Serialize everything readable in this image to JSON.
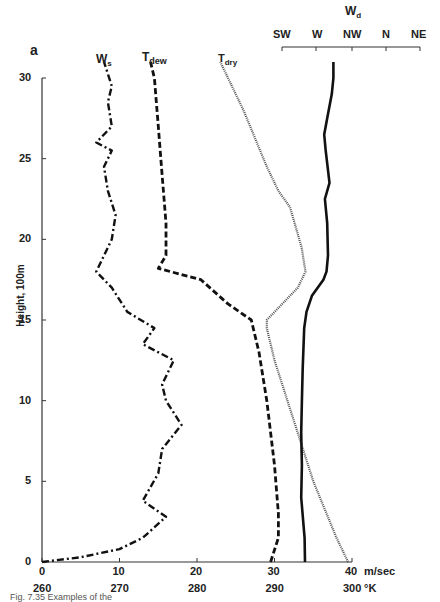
{
  "figure": {
    "panel_letter": "a",
    "caption_partial": "Fig. 7.35   Examples of the"
  },
  "chart_data": {
    "type": "line",
    "title": "",
    "ylabel": "Height, 100m",
    "ylim": [
      0,
      30
    ],
    "yticks": [
      0,
      5,
      10,
      15,
      20,
      25,
      30
    ],
    "x_axes": [
      {
        "name": "speed",
        "label": "m/sec",
        "ticks": [
          0,
          10,
          20,
          30,
          40
        ],
        "range": [
          0,
          40
        ]
      },
      {
        "name": "temperature",
        "label": "°K",
        "ticks": [
          260,
          270,
          280,
          290,
          300
        ],
        "range": [
          260,
          300
        ]
      },
      {
        "name": "direction",
        "label": "Wd",
        "position": "top",
        "ticks": [
          "SW",
          "W",
          "NW",
          "N",
          "NE"
        ]
      }
    ],
    "grid": false,
    "series": [
      {
        "name": "Ws",
        "axis": "speed",
        "style": "dash-dot",
        "points": [
          [
            0,
            0
          ],
          [
            5,
            0.3
          ],
          [
            10,
            0.8
          ],
          [
            13,
            1.5
          ],
          [
            16,
            2.8
          ],
          [
            13,
            3.8
          ],
          [
            15,
            5.5
          ],
          [
            15.5,
            7
          ],
          [
            18,
            8.5
          ],
          [
            16,
            10
          ],
          [
            15.5,
            11
          ],
          [
            17,
            12.5
          ],
          [
            13,
            13.5
          ],
          [
            14.5,
            14.5
          ],
          [
            11,
            15.5
          ],
          [
            9,
            17
          ],
          [
            7,
            18
          ],
          [
            9,
            20
          ],
          [
            9.5,
            21.5
          ],
          [
            8.5,
            23
          ],
          [
            8,
            24.5
          ],
          [
            9,
            25.5
          ],
          [
            7,
            26
          ],
          [
            9,
            27
          ],
          [
            8.5,
            28.5
          ],
          [
            9,
            29.5
          ],
          [
            8,
            31
          ]
        ]
      },
      {
        "name": "Tdew",
        "axis": "temperature",
        "style": "dashed",
        "points": [
          [
            289.5,
            0
          ],
          [
            290.5,
            1.5
          ],
          [
            290.5,
            3
          ],
          [
            290,
            6
          ],
          [
            289,
            10
          ],
          [
            288,
            13
          ],
          [
            287,
            15
          ],
          [
            284,
            16
          ],
          [
            280.5,
            17.5
          ],
          [
            275,
            18.2
          ],
          [
            276,
            19
          ],
          [
            276,
            21
          ],
          [
            275.5,
            24
          ],
          [
            275,
            27
          ],
          [
            274.5,
            30
          ],
          [
            274,
            31
          ]
        ]
      },
      {
        "name": "Tdry",
        "axis": "temperature",
        "style": "dotted",
        "points": [
          [
            299.5,
            0
          ],
          [
            298,
            1.5
          ],
          [
            295,
            5
          ],
          [
            292,
            9.5
          ],
          [
            290,
            12.5
          ],
          [
            289,
            14.5
          ],
          [
            289,
            15
          ],
          [
            293,
            17
          ],
          [
            294,
            18
          ],
          [
            293.5,
            19.5
          ],
          [
            292,
            22
          ],
          [
            290.5,
            23
          ],
          [
            289,
            24.5
          ],
          [
            286,
            28
          ],
          [
            283,
            31
          ]
        ]
      },
      {
        "name": "Wd",
        "axis": "direction",
        "style": "solid",
        "points_deg": [
          [
            255,
            0
          ],
          [
            254.5,
            1.5
          ],
          [
            250,
            4
          ],
          [
            251,
            6
          ],
          [
            250,
            8
          ],
          [
            251,
            10
          ],
          [
            252,
            12
          ],
          [
            254,
            14.5
          ],
          [
            257,
            15.5
          ],
          [
            264,
            16.5
          ],
          [
            279,
            17.5
          ],
          [
            283,
            18
          ],
          [
            285,
            19
          ],
          [
            284,
            21
          ],
          [
            281,
            22.5
          ],
          [
            287,
            23.5
          ],
          [
            282,
            25.5
          ],
          [
            280,
            26.5
          ],
          [
            284,
            27.5
          ],
          [
            290,
            29
          ],
          [
            292,
            30
          ],
          [
            292,
            31
          ]
        ]
      }
    ],
    "legend": [
      "Ws",
      "Tdew",
      "Tdry",
      "Wd"
    ],
    "legend_position": "inline labels at top of each curve"
  },
  "labels": {
    "ws": "W",
    "ws_sub": "s",
    "tdew": "T",
    "tdew_sub": "dew",
    "tdry": "T",
    "tdry_sub": "dry",
    "wd": "W",
    "wd_sub": "d",
    "x_speed_unit": "m/sec",
    "x_temp_unit": "°K",
    "y_label": "Height, 100m",
    "y_ticks": [
      "0",
      "5",
      "10",
      "15",
      "20",
      "25",
      "30"
    ],
    "x_speed_ticks": [
      "0",
      "10",
      "20",
      "30",
      "40"
    ],
    "x_temp_ticks": [
      "260",
      "270",
      "280",
      "290",
      "300"
    ],
    "wd_ticks": [
      "SW",
      "W",
      "NW",
      "N",
      "NE"
    ]
  }
}
